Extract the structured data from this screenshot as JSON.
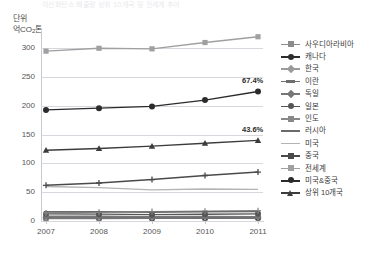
{
  "title_faint": "이산화탄소 배출량 상위 10개국 및 전세계 추이",
  "unit": {
    "line1": "단위",
    "line2_prefix": "억CO",
    "line2_sub": "2",
    "line2_suffix": "톤"
  },
  "chart_data": {
    "type": "line",
    "title": "이산화탄소 배출량 상위 10개국 및 전세계 추이",
    "xlabel": "",
    "ylabel": "억CO2톤",
    "unit": "억CO2톤",
    "grid": true,
    "legend_position": "right",
    "x": [
      "2007",
      "2008",
      "2009",
      "2010",
      "2011"
    ],
    "xlim": [
      2007,
      2011
    ],
    "ylim": [
      0,
      330
    ],
    "yticks": [
      0,
      50,
      100,
      150,
      200,
      250,
      300
    ],
    "annotations": [
      {
        "text": "67.4%",
        "series": "미국&중국",
        "x": "2011",
        "y": 225
      },
      {
        "text": "43.6%",
        "series": "상위 10개국",
        "x": "2011",
        "y": 140
      }
    ],
    "series": [
      {
        "name": "사우디아라비아",
        "color": "#8c8c8c",
        "marker": "square",
        "values": [
          4.1,
          4.4,
          4.6,
          4.8,
          5.1
        ]
      },
      {
        "name": "캐나다",
        "color": "#2e2e2e",
        "marker": "circle",
        "values": [
          5.9,
          5.7,
          5.4,
          5.5,
          5.5
        ]
      },
      {
        "name": "한국",
        "color": "#9a9a9a",
        "marker": "diamond",
        "values": [
          5.2,
          5.4,
          5.4,
          5.9,
          6.1
        ]
      },
      {
        "name": "이란",
        "color": "#6f6f6f",
        "marker": "dash",
        "values": [
          5.3,
          5.4,
          5.6,
          5.7,
          5.9
        ]
      },
      {
        "name": "독일",
        "color": "#777777",
        "marker": "diamond",
        "values": [
          8.3,
          8.2,
          7.6,
          7.9,
          7.6
        ]
      },
      {
        "name": "일본",
        "color": "#555555",
        "marker": "circle",
        "values": [
          12.6,
          11.9,
          11.0,
          11.6,
          12.4
        ]
      },
      {
        "name": "인도",
        "color": "#888888",
        "marker": "cross",
        "values": [
          14.0,
          15.0,
          16.3,
          17.1,
          18.0
        ]
      },
      {
        "name": "러시아",
        "color": "#6a6a6a",
        "marker": "none",
        "values": [
          16.0,
          16.2,
          15.2,
          16.0,
          16.5
        ]
      },
      {
        "name": "미국",
        "color": "#b4b4b4",
        "marker": "none",
        "values": [
          60.0,
          58.0,
          54.0,
          55.5,
          54.9
        ]
      },
      {
        "name": "중국",
        "color": "#4a4a4a",
        "marker": "cross",
        "values": [
          62.0,
          66.0,
          72.0,
          79.0,
          85.0
        ]
      },
      {
        "name": "전세계",
        "color": "#a0a0a0",
        "marker": "square",
        "values": [
          295.0,
          300.0,
          299.0,
          310.0,
          320.0
        ]
      },
      {
        "name": "미국&중국",
        "color": "#2b2b2b",
        "marker": "circle",
        "values": [
          193.0,
          196.0,
          199.0,
          210.0,
          225.0
        ]
      },
      {
        "name": "상위 10개국",
        "color": "#3c3c3c",
        "marker": "triangle",
        "values": [
          123.0,
          126.0,
          130.0,
          135.0,
          140.0
        ]
      }
    ]
  }
}
